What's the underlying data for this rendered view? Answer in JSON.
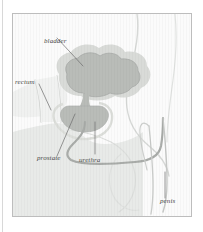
{
  "figure": {
    "background_color": "#fbfbfb",
    "frame_color": "#bdbdbd",
    "page_background": "#ffffff",
    "label_color": "#4a4a4a",
    "leader_line_color": "#6d6d6d"
  },
  "organs": {
    "bladder": {
      "name": "bladder",
      "fill_color": "#b9bcb8",
      "halo_color": "#d9dbd8"
    },
    "prostate": {
      "name": "prostate",
      "fill_color": "#b9bcb8"
    },
    "urethra": {
      "name": "urethra",
      "stroke_color": "#a9aca9"
    },
    "penis": {
      "name": "penis",
      "stroke_color": "#c4c6c4"
    },
    "rectum": {
      "name": "rectum",
      "stroke_color": "#d2d4d2"
    },
    "body_outline": {
      "name": "body-outline",
      "stroke_color": "#d6d8d6"
    },
    "pelvic_shading": {
      "name": "pelvic-shading",
      "fill_color": "#e3e5e3"
    }
  },
  "labels": [
    {
      "id": "bladder",
      "text": "bladder",
      "x": 31,
      "y": 28,
      "leader": "M 52 35 L 76 57"
    },
    {
      "id": "rectum",
      "text": "rectum",
      "x": 8,
      "y": 74,
      "leader": "M 35 80 L 47 104"
    },
    {
      "id": "prostate",
      "text": "prostate",
      "x": 28,
      "y": 150,
      "leader": "M 48 147 L 60 94"
    },
    {
      "id": "urethra",
      "text": "urethra",
      "x": 72,
      "y": 152,
      "leader": "M 90 147 L 90 113"
    },
    {
      "id": "penis",
      "text": "penis",
      "x": 159,
      "y": 196,
      "leader": "M 161 193 L 161 166"
    }
  ]
}
